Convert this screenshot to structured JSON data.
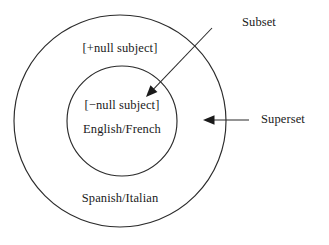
{
  "diagram": {
    "type": "venn-nested-circles",
    "background_color": "#ffffff",
    "stroke_color": "#2b2b2b",
    "text_color": "#1a1a1a",
    "outer_set": {
      "feature_label": "[+null subject]",
      "languages_label": "Spanish/Italian",
      "role_label": "Superset",
      "center_x": 120,
      "center_y": 121,
      "radius": 106
    },
    "inner_set": {
      "feature_label": "[−null subject]",
      "languages_label": "English/French",
      "role_label": "Subset",
      "center_x": 122,
      "center_y": 121,
      "radius": 55
    },
    "annotations": [
      {
        "name": "subset",
        "label": "Subset",
        "from_x": 212,
        "from_y": 28,
        "to_x": 146,
        "to_y": 97
      },
      {
        "name": "superset",
        "label": "Superset",
        "from_x": 249,
        "from_y": 120,
        "to_x": 203,
        "to_y": 120
      }
    ]
  }
}
